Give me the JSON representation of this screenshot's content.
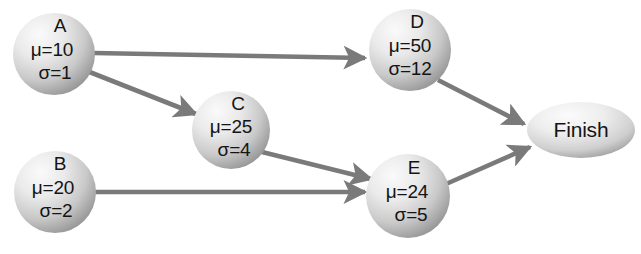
{
  "diagram": {
    "type": "directed-graph",
    "background_color": "#ffffff",
    "node_fill_light": "#f2f2f2",
    "node_fill_dark": "#9c9c9c",
    "edge_color": "#7a7a7a",
    "text_color": "#141414",
    "nodes": [
      {
        "id": "A",
        "name": "A",
        "shape": "circle",
        "mu_label": "μ=10",
        "sigma_label": "σ=1",
        "mu": 10,
        "sigma": 1,
        "cx": 54,
        "cy": 54,
        "r": 41
      },
      {
        "id": "B",
        "name": "B",
        "shape": "circle",
        "mu_label": "μ=20",
        "sigma_label": "σ=2",
        "mu": 20,
        "sigma": 2,
        "cx": 55,
        "cy": 192,
        "r": 41
      },
      {
        "id": "C",
        "name": "C",
        "shape": "circle",
        "mu_label": "μ=25",
        "sigma_label": "σ=4",
        "mu": 25,
        "sigma": 4,
        "cx": 231,
        "cy": 130,
        "r": 39
      },
      {
        "id": "D",
        "name": "D",
        "shape": "circle",
        "mu_label": "μ=50",
        "sigma_label": "σ=12",
        "mu": 50,
        "sigma": 12,
        "cx": 410,
        "cy": 50,
        "r": 41
      },
      {
        "id": "E",
        "name": "E",
        "shape": "circle",
        "mu_label": "μ=24",
        "sigma_label": "σ=5",
        "mu": 24,
        "sigma": 5,
        "cx": 408,
        "cy": 196,
        "r": 42
      }
    ],
    "terminal_node": {
      "id": "Finish",
      "label": "Finish",
      "shape": "ellipse",
      "cx": 581,
      "cy": 130,
      "rx": 54,
      "ry": 28
    },
    "edges": [
      {
        "id": "A-D",
        "from": "A",
        "to": "D",
        "x1": 94,
        "y1": 53,
        "x2": 365,
        "y2": 58
      },
      {
        "id": "A-C",
        "from": "A",
        "to": "C",
        "x1": 87,
        "y1": 71,
        "x2": 196,
        "y2": 114
      },
      {
        "id": "B-E",
        "from": "B",
        "to": "E",
        "x1": 95,
        "y1": 192,
        "x2": 365,
        "y2": 192
      },
      {
        "id": "C-E",
        "from": "C",
        "to": "E",
        "x1": 258,
        "y1": 151,
        "x2": 371,
        "y2": 179
      },
      {
        "id": "D-Finish",
        "from": "D",
        "to": "Finish",
        "x1": 438,
        "y1": 80,
        "x2": 524,
        "y2": 124
      },
      {
        "id": "E-Finish",
        "from": "E",
        "to": "Finish",
        "x1": 446,
        "y1": 184,
        "x2": 530,
        "y2": 147
      }
    ]
  }
}
